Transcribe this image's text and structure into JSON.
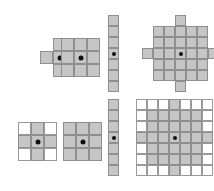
{
  "figure": {
    "background_color": "#ffffff",
    "fill_color": "#c6c6c6",
    "line_color": "#8f8f8f",
    "empty_color": "#ffffff",
    "origin_color": "#111111",
    "origin_label": "origin"
  },
  "shapes": [
    {
      "name": "cross-unbounded",
      "label": "cross",
      "bounded": false,
      "rows": 3,
      "cols": 3,
      "cell_px": 13,
      "x": 40,
      "y": 38,
      "origin_row": 1,
      "origin_col": 1,
      "mask": [
        [
          0,
          1,
          0
        ],
        [
          1,
          1,
          1
        ],
        [
          0,
          1,
          0
        ]
      ]
    },
    {
      "name": "square-unbounded",
      "label": "square",
      "bounded": false,
      "rows": 3,
      "cols": 3,
      "cell_px": 13,
      "x": 61,
      "y": 38,
      "origin_row": 1,
      "origin_col": 1,
      "mask": [
        [
          1,
          1,
          1
        ],
        [
          1,
          1,
          1
        ],
        [
          1,
          1,
          1
        ]
      ]
    },
    {
      "name": "vertical-line-unbounded",
      "label": "vertical line",
      "bounded": false,
      "rows": 7,
      "cols": 1,
      "cell_px": 11,
      "x": 108,
      "y": 15,
      "origin_row": 3,
      "origin_col": 0,
      "mask": [
        [
          1
        ],
        [
          1
        ],
        [
          1
        ],
        [
          1
        ],
        [
          1
        ],
        [
          1
        ],
        [
          1
        ]
      ]
    },
    {
      "name": "disk-unbounded",
      "label": "disk",
      "bounded": false,
      "rows": 7,
      "cols": 7,
      "cell_px": 11,
      "x": 142,
      "y": 15,
      "origin_row": 3,
      "origin_col": 3,
      "mask": [
        [
          0,
          0,
          0,
          1,
          0,
          0,
          0
        ],
        [
          0,
          1,
          1,
          1,
          1,
          1,
          0
        ],
        [
          0,
          1,
          1,
          1,
          1,
          1,
          0
        ],
        [
          1,
          1,
          1,
          1,
          1,
          1,
          1
        ],
        [
          0,
          1,
          1,
          1,
          1,
          1,
          0
        ],
        [
          0,
          1,
          1,
          1,
          1,
          1,
          0
        ],
        [
          0,
          0,
          0,
          1,
          0,
          0,
          0
        ]
      ]
    },
    {
      "name": "cross-bounded",
      "label": "cross in bounding box",
      "bounded": true,
      "rows": 3,
      "cols": 3,
      "cell_px": 13,
      "x": 18,
      "y": 122,
      "origin_row": 1,
      "origin_col": 1,
      "mask": [
        [
          0,
          1,
          0
        ],
        [
          1,
          1,
          1
        ],
        [
          0,
          1,
          0
        ]
      ]
    },
    {
      "name": "square-bounded",
      "label": "square in bounding box",
      "bounded": true,
      "rows": 3,
      "cols": 3,
      "cell_px": 13,
      "x": 63,
      "y": 122,
      "origin_row": 1,
      "origin_col": 1,
      "mask": [
        [
          1,
          1,
          1
        ],
        [
          1,
          1,
          1
        ],
        [
          1,
          1,
          1
        ]
      ]
    },
    {
      "name": "vertical-line-bounded",
      "label": "vertical line in bounding box",
      "bounded": true,
      "rows": 7,
      "cols": 1,
      "cell_px": 11,
      "x": 108,
      "y": 99,
      "origin_row": 3,
      "origin_col": 0,
      "mask": [
        [
          1
        ],
        [
          1
        ],
        [
          1
        ],
        [
          1
        ],
        [
          1
        ],
        [
          1
        ],
        [
          1
        ]
      ]
    },
    {
      "name": "disk-bounded",
      "label": "disk in bounding box",
      "bounded": true,
      "rows": 7,
      "cols": 7,
      "cell_px": 11,
      "x": 136,
      "y": 99,
      "origin_row": 3,
      "origin_col": 3,
      "mask": [
        [
          0,
          0,
          0,
          1,
          0,
          0,
          0
        ],
        [
          0,
          1,
          1,
          1,
          1,
          1,
          0
        ],
        [
          0,
          1,
          1,
          1,
          1,
          1,
          0
        ],
        [
          1,
          1,
          1,
          1,
          1,
          1,
          1
        ],
        [
          0,
          1,
          1,
          1,
          1,
          1,
          0
        ],
        [
          0,
          1,
          1,
          1,
          1,
          1,
          0
        ],
        [
          0,
          0,
          0,
          1,
          0,
          0,
          0
        ]
      ]
    }
  ]
}
